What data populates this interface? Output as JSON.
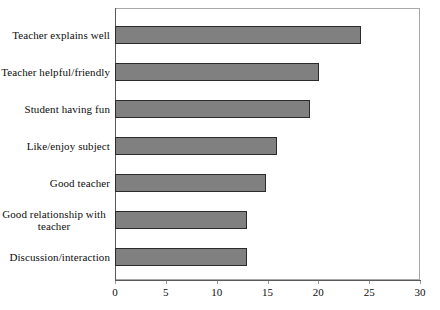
{
  "chart_data": {
    "type": "bar",
    "orientation": "horizontal",
    "title": "",
    "xlabel": "",
    "ylabel": "",
    "categories": [
      "Teacher explains well",
      "Teacher helpful/friendly",
      "Student having fun",
      "Like/enjoy subject",
      "Good teacher",
      "Good relationship with teacher",
      "Discussion/interaction"
    ],
    "values": [
      24.2,
      20.1,
      19.2,
      15.9,
      14.9,
      13.0,
      13.0
    ],
    "xlim": [
      0,
      30
    ],
    "xticks": [
      0,
      5,
      10,
      15,
      20,
      25,
      30
    ],
    "xtick_labels": [
      "0",
      "5",
      "10",
      "15",
      "20",
      "25",
      "30"
    ],
    "grid": false,
    "legend": null,
    "bar_color": "#808080",
    "bar_edge_color": "#2b2b2b",
    "frame_color": "#a8a8a8",
    "background_color": "#ffffff"
  }
}
